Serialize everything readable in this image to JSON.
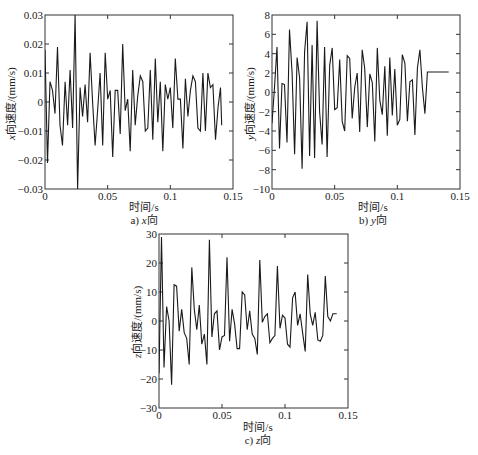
{
  "chart_data": [
    {
      "type": "line",
      "id": "x",
      "caption_prefix": "a) ",
      "caption_axis": "x",
      "caption_suffix": "向",
      "xlabel": "时间/s",
      "ylabel_axis": "x",
      "ylabel_suffix": "向速度/(mm/s)",
      "xlim": [
        0,
        0.15
      ],
      "ylim": [
        -0.03,
        0.03
      ],
      "xticks": [
        0,
        0.05,
        0.1,
        0.15
      ],
      "xtick_labels": [
        "0",
        "0.05",
        "0.1",
        "0.15"
      ],
      "yticks": [
        -0.03,
        -0.02,
        -0.01,
        0,
        0.01,
        0.02,
        0.03
      ],
      "ytick_labels": [
        "-0.03",
        "-0.02",
        "-0.01",
        "0",
        "0.01",
        "0.02",
        "0.03"
      ],
      "grid": false,
      "x": [
        0,
        0.002,
        0.004,
        0.006,
        0.008,
        0.01,
        0.012,
        0.014,
        0.016,
        0.018,
        0.02,
        0.022,
        0.024,
        0.026,
        0.028,
        0.03,
        0.032,
        0.034,
        0.036,
        0.038,
        0.04,
        0.042,
        0.044,
        0.046,
        0.048,
        0.05,
        0.052,
        0.054,
        0.056,
        0.058,
        0.06,
        0.062,
        0.064,
        0.066,
        0.068,
        0.07,
        0.072,
        0.074,
        0.076,
        0.078,
        0.08,
        0.082,
        0.084,
        0.086,
        0.088,
        0.09,
        0.092,
        0.094,
        0.096,
        0.098,
        0.1,
        0.102,
        0.104,
        0.106,
        0.108,
        0.11,
        0.112,
        0.114,
        0.116,
        0.118,
        0.12,
        0.122,
        0.124,
        0.126,
        0.128,
        0.13,
        0.132,
        0.134,
        0.136,
        0.138,
        0.14,
        0.141
      ],
      "values": [
        0.018,
        -0.021,
        0.007,
        0.004,
        -0.004,
        0.019,
        -0.008,
        -0.015,
        0.007,
        -0.008,
        0.011,
        -0.009,
        0.03,
        -0.03,
        0.005,
        -0.005,
        0.006,
        -0.007,
        0.017,
        0.0,
        -0.015,
        -0.003,
        0.01,
        -0.015,
        0.017,
        0.001,
        0.004,
        -0.019,
        0.004,
        0.004,
        -0.011,
        0.02,
        -0.003,
        0.001,
        -0.017,
        0.011,
        -0.008,
        0.002,
        0.009,
        0.007,
        -0.01,
        -0.009,
        0.011,
        -0.013,
        0.015,
        -0.007,
        0.007,
        -0.017,
        0.006,
        0.001,
        0.005,
        -0.009,
        0.015,
        0.001,
        0.001,
        -0.016,
        0.008,
        -0.005,
        0.004,
        0.009,
        0.007,
        -0.009,
        -0.01,
        0.01,
        -0.01,
        0.01,
        0.005,
        0.006,
        -0.013,
        -0.002,
        0.005,
        -0.008
      ]
    },
    {
      "type": "line",
      "id": "y",
      "caption_prefix": "b) ",
      "caption_axis": "y",
      "caption_suffix": "向",
      "xlabel": "时间/s",
      "ylabel_axis": "y",
      "ylabel_suffix": "向速度/(mm/s)",
      "xlim": [
        0,
        0.15
      ],
      "ylim": [
        -10,
        8
      ],
      "xticks": [
        0,
        0.05,
        0.1,
        0.15
      ],
      "xtick_labels": [
        "0",
        "0.05",
        "0.1",
        "0.15"
      ],
      "yticks": [
        -10,
        -8,
        -6,
        -4,
        -2,
        0,
        2,
        4,
        6,
        8
      ],
      "ytick_labels": [
        "-10",
        "-8",
        "-6",
        "-4",
        "-2",
        "0",
        "2",
        "4",
        "6",
        "8"
      ],
      "grid": false,
      "x": [
        0,
        0.002,
        0.004,
        0.006,
        0.008,
        0.01,
        0.012,
        0.014,
        0.016,
        0.018,
        0.02,
        0.022,
        0.024,
        0.026,
        0.028,
        0.03,
        0.032,
        0.034,
        0.036,
        0.038,
        0.04,
        0.042,
        0.044,
        0.046,
        0.048,
        0.05,
        0.052,
        0.054,
        0.056,
        0.058,
        0.06,
        0.062,
        0.064,
        0.066,
        0.068,
        0.07,
        0.072,
        0.074,
        0.076,
        0.078,
        0.08,
        0.082,
        0.084,
        0.086,
        0.088,
        0.09,
        0.092,
        0.094,
        0.096,
        0.098,
        0.1,
        0.102,
        0.104,
        0.106,
        0.108,
        0.11,
        0.112,
        0.114,
        0.116,
        0.118,
        0.12,
        0.122,
        0.124,
        0.126,
        0.128,
        0.13,
        0.132,
        0.134,
        0.136,
        0.138,
        0.14,
        0.141
      ],
      "values": [
        -3.2,
        0.5,
        4.7,
        -5.8,
        0.9,
        0.8,
        -5.2,
        6.5,
        2.0,
        -6.4,
        3.6,
        1.5,
        -7.9,
        4.2,
        7.3,
        -6.6,
        4.9,
        -6.8,
        7.4,
        -2.0,
        -5.4,
        4.7,
        -6.7,
        2.8,
        4.6,
        -1.8,
        -1.6,
        3.4,
        -3.0,
        -4.0,
        3.8,
        3.5,
        -2.7,
        0.5,
        2.0,
        -4.1,
        4.4,
        2.5,
        -3.6,
        1.9,
        1.0,
        -5.1,
        4.6,
        -0.8,
        -2.3,
        2.7,
        -4.5,
        3.6,
        -2.4,
        2.4,
        -3.4,
        -2.8,
        3.9,
        3.0,
        -3.0,
        1.1,
        1.3,
        -4.4,
        2.5,
        4.4,
        0.5,
        -2.2,
        2.1,
        2.1,
        2.1,
        2.1,
        2.1,
        2.1,
        2.1,
        2.1,
        2.1,
        2.1
      ]
    },
    {
      "type": "line",
      "id": "z",
      "caption_prefix": "c) ",
      "caption_axis": "z",
      "caption_suffix": "向",
      "xlabel": "时间/s",
      "ylabel_axis": "z",
      "ylabel_suffix": "向速度/(mm/s)",
      "xlim": [
        0,
        0.15
      ],
      "ylim": [
        -30,
        30
      ],
      "xticks": [
        0,
        0.05,
        0.1,
        0.15
      ],
      "xtick_labels": [
        "0",
        "0.05",
        "0.1",
        "0.15"
      ],
      "yticks": [
        -30,
        -20,
        -10,
        0,
        10,
        20,
        30
      ],
      "ytick_labels": [
        "-30",
        "-20",
        "-10",
        "0",
        "10",
        "20",
        "30"
      ],
      "grid": false,
      "x": [
        0,
        0.002,
        0.004,
        0.006,
        0.008,
        0.01,
        0.012,
        0.014,
        0.016,
        0.018,
        0.02,
        0.022,
        0.024,
        0.026,
        0.028,
        0.03,
        0.032,
        0.034,
        0.036,
        0.038,
        0.04,
        0.042,
        0.044,
        0.046,
        0.048,
        0.05,
        0.052,
        0.054,
        0.056,
        0.058,
        0.06,
        0.062,
        0.064,
        0.066,
        0.068,
        0.07,
        0.072,
        0.074,
        0.076,
        0.078,
        0.08,
        0.082,
        0.084,
        0.086,
        0.088,
        0.09,
        0.092,
        0.094,
        0.096,
        0.098,
        0.1,
        0.102,
        0.104,
        0.106,
        0.108,
        0.11,
        0.112,
        0.114,
        0.116,
        0.118,
        0.12,
        0.122,
        0.124,
        0.126,
        0.128,
        0.13,
        0.132,
        0.134,
        0.136,
        0.138,
        0.14,
        0.141
      ],
      "values": [
        -18,
        29,
        -16,
        5,
        0,
        -22,
        12.5,
        12,
        -3.5,
        4,
        -4,
        -6,
        -15,
        18.5,
        4,
        -3,
        5.5,
        -8,
        -4.5,
        -15,
        28,
        -5.5,
        2.5,
        3.5,
        -10,
        -5.5,
        -5,
        22,
        -7,
        4,
        -1,
        -9.5,
        -9.5,
        10,
        9,
        -3,
        3.5,
        -4.5,
        -6,
        -11.5,
        21,
        -0.5,
        1.5,
        2.5,
        -7.5,
        -6,
        -5,
        19,
        -2.5,
        2,
        1,
        -8,
        -9,
        8,
        10,
        -1.5,
        2.5,
        -4,
        -10.5,
        16,
        2.5,
        -1.5,
        3,
        -6.5,
        -7,
        -5,
        15.5,
        1.5,
        0,
        2.5,
        2.5,
        2.5
      ]
    }
  ],
  "panels": {
    "a": {
      "xlabel": "时间/s",
      "ylabel_axis": "x",
      "ylabel_suffix": "向速度/(mm/s)",
      "caption_prefix": "a) ",
      "caption_axis": "x",
      "caption_suffix": "向"
    },
    "b": {
      "xlabel": "时间/s",
      "ylabel_axis": "y",
      "ylabel_suffix": "向速度/(mm/s)",
      "caption_prefix": "b) ",
      "caption_axis": "y",
      "caption_suffix": "向"
    },
    "c": {
      "xlabel": "时间/s",
      "ylabel_axis": "z",
      "ylabel_suffix": "向速度/(mm/s)",
      "caption_prefix": "c) ",
      "caption_axis": "z",
      "caption_suffix": "向"
    }
  },
  "colors": {
    "line": "#1a1a1a",
    "axis": "#333333",
    "background": "#ffffff"
  }
}
